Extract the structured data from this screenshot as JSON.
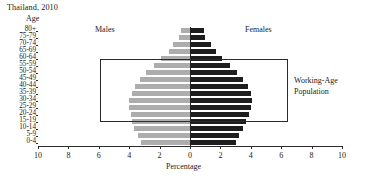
{
  "title": "Thailand, 2010",
  "age_axis_caption": "Age",
  "x_axis_caption": "Percentage",
  "series_labels": {
    "male": "Males",
    "female": "Females"
  },
  "annotation": {
    "line1": "Working-Age",
    "line2": "Population"
  },
  "colors": {
    "male": "#adadad",
    "female": "#1e1e1e",
    "axis": "#2b2b2b",
    "text": "#1a1a1a"
  },
  "x_ticks": [
    "10",
    "8",
    "6",
    "4",
    "2",
    "0",
    "2",
    "4",
    "6",
    "8",
    "10"
  ],
  "chart_data": {
    "type": "bar",
    "subtype": "population-pyramid",
    "title": "Thailand, 2010",
    "xlabel": "Percentage",
    "ylabel": "Age",
    "xlim": [
      -10,
      10
    ],
    "xtick_values": [
      -10,
      -8,
      -6,
      -4,
      -2,
      0,
      2,
      4,
      6,
      8,
      10
    ],
    "xtick_labels": [
      "10",
      "8",
      "6",
      "4",
      "2",
      "0",
      "2",
      "4",
      "6",
      "8",
      "10"
    ],
    "grid": false,
    "legend": [
      "Males",
      "Females"
    ],
    "legend_position": "inline-top",
    "categories": [
      "80+",
      "75-79",
      "70-74",
      "65-69",
      "60-64",
      "55-59",
      "50-54",
      "45-49",
      "40-44",
      "35-39",
      "30-34",
      "25-29",
      "20-24",
      "15-19",
      "10-14",
      "5-9",
      "0-4"
    ],
    "series": [
      {
        "name": "Males",
        "side": "left",
        "color": "#adadad",
        "values": [
          0.6,
          0.7,
          1.1,
          1.4,
          1.9,
          2.4,
          2.9,
          3.3,
          3.6,
          3.8,
          4.0,
          4.0,
          3.9,
          3.8,
          3.7,
          3.4,
          3.2
        ]
      },
      {
        "name": "Females",
        "side": "right",
        "color": "#1e1e1e",
        "values": [
          0.9,
          1.0,
          1.4,
          1.7,
          2.1,
          2.6,
          3.1,
          3.5,
          3.8,
          4.0,
          4.1,
          4.0,
          3.9,
          3.7,
          3.5,
          3.2,
          3.0
        ]
      }
    ],
    "annotations": [
      {
        "text": "Working-Age Population",
        "type": "rect-callout",
        "covers_categories": [
          "15-19",
          "60-64"
        ]
      }
    ]
  }
}
